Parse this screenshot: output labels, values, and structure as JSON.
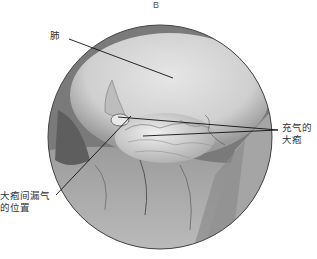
{
  "figure": {
    "panel_label": "B",
    "view": "thoracoscopic circular view",
    "labels": {
      "lung": "肺",
      "inflated_bulla_line1": "充气的",
      "inflated_bulla_line2": "大疱",
      "leak_site_line1": "大疱间漏气",
      "leak_site_line2": "的位置"
    },
    "colors": {
      "rim": "#6a6a6a",
      "lung": "#d8d8d8",
      "bulla": "#e4e4e4",
      "shadow": "#8a8a8a",
      "leader_line": "#111111"
    }
  }
}
